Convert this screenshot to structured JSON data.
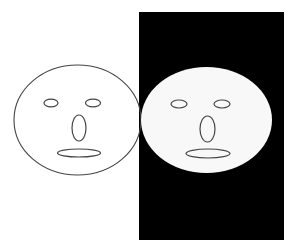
{
  "canvas": {
    "width": 295,
    "height": 252,
    "background": "#ffffff"
  },
  "colors": {
    "stroke": "#444444",
    "face_fill": "#ffffff",
    "right_face_fill": "#f8f8f8",
    "panel": "#000000"
  },
  "panel": {
    "x": 139,
    "y": 12,
    "width": 145,
    "height": 228
  },
  "faces": [
    {
      "name": "left-face",
      "outline": {
        "cx": 77.5,
        "cy": 120,
        "rx": 63.5,
        "ry": 55
      },
      "left_eye": {
        "cx": 51,
        "cy": 103,
        "rx": 7,
        "ry": 3.8
      },
      "right_eye": {
        "cx": 93,
        "cy": 103,
        "rx": 7.5,
        "ry": 3.8
      },
      "nose": {
        "cx": 79,
        "cy": 128,
        "rx": 7,
        "ry": 13
      },
      "mouth": {
        "cx": 79,
        "cy": 153,
        "rx": 21.5,
        "ry": 4
      }
    },
    {
      "name": "right-face",
      "outline": {
        "cx": 206.5,
        "cy": 120,
        "rx": 65.5,
        "ry": 53
      },
      "left_eye": {
        "cx": 179,
        "cy": 104,
        "rx": 8,
        "ry": 4
      },
      "right_eye": {
        "cx": 222,
        "cy": 104,
        "rx": 8,
        "ry": 4
      },
      "nose": {
        "cx": 207.5,
        "cy": 129,
        "rx": 7.5,
        "ry": 13
      },
      "mouth": {
        "cx": 208,
        "cy": 153.5,
        "rx": 22,
        "ry": 4.5
      }
    }
  ]
}
